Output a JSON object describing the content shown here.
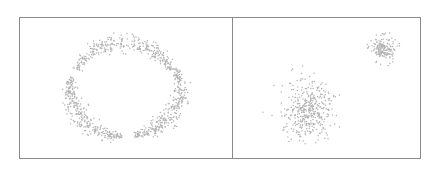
{
  "chart_data": [
    {
      "type": "scatter",
      "title": "",
      "xlabel": "",
      "ylabel": "",
      "grid": false,
      "legend": null,
      "description": "Three curved arc clusters forming a broken ring (top, lower-left, lower-right)",
      "point_color": "#b3b3b3",
      "panel_box": [
        19,
        17,
        232,
        159
      ],
      "clusters": [
        {
          "name": "top-arc",
          "shape": "arc",
          "cx": 124,
          "cy": 90,
          "r": 52,
          "angle_start_deg": 205,
          "angle_end_deg": 335,
          "thickness": 5,
          "n": 320
        },
        {
          "name": "lower-left-arc",
          "shape": "arc",
          "cx": 122,
          "cy": 88,
          "r": 52,
          "angle_start_deg": 90,
          "angle_end_deg": 193,
          "thickness": 5,
          "n": 320
        },
        {
          "name": "lower-right-arc",
          "shape": "arc",
          "cx": 128,
          "cy": 88,
          "r": 52,
          "angle_start_deg": -25,
          "angle_end_deg": 83,
          "thickness": 5,
          "n": 320
        }
      ]
    },
    {
      "type": "scatter",
      "title": "",
      "xlabel": "",
      "ylabel": "",
      "grid": false,
      "legend": null,
      "description": "Two Gaussian blobs: large diffuse cluster lower-left, small dense cluster upper-right",
      "point_color": "#b3b3b3",
      "panel_box": [
        232,
        17,
        421,
        159
      ],
      "clusters": [
        {
          "name": "large-blob",
          "shape": "gaussian",
          "cx": 308,
          "cy": 110,
          "sx": 12,
          "sy": 14,
          "n": 420
        },
        {
          "name": "small-blob",
          "shape": "gaussian",
          "cx": 383,
          "cy": 48,
          "sx": 6,
          "sy": 6,
          "n": 180
        }
      ]
    }
  ]
}
